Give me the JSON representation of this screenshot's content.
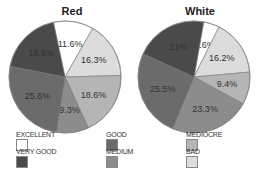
{
  "chart_data": [
    {
      "type": "pie",
      "title": "Red",
      "categories": [
        "EXCELLENT",
        "BAD",
        "MEDIOCRE",
        "MEDIUM",
        "GOOD",
        "VERY GOOD"
      ],
      "values": [
        11.6,
        16.3,
        18.6,
        9.3,
        25.6,
        18.6
      ],
      "labels": [
        "11.6%",
        "16.3%",
        "18.6%",
        "9.3%",
        "25.6%",
        "18.6%"
      ],
      "unit": "%"
    },
    {
      "type": "pie",
      "title": "White",
      "categories": [
        "EXCELLENT",
        "BAD",
        "MEDIOCRE",
        "MEDIUM",
        "GOOD",
        "VERY GOOD"
      ],
      "values": [
        4.6,
        16.2,
        9.4,
        23.3,
        25.5,
        21
      ],
      "labels": [
        "4.6%",
        "16.2%",
        "9.4%",
        "23.3%",
        "25.5%",
        "21%"
      ],
      "unit": "%"
    }
  ],
  "titles": {
    "red": "Red",
    "white": "White"
  },
  "legend": [
    {
      "label": "EXCELLENT",
      "color": "#ffffff"
    },
    {
      "label": "VERY GOOD",
      "color": "#4a4a4a"
    },
    {
      "label": "GOOD",
      "color": "#6b6b6b"
    },
    {
      "label": "MEDIUM",
      "color": "#8c8c8c"
    },
    {
      "label": "MEDIOCRE",
      "color": "#b5b5b5"
    },
    {
      "label": "BAD",
      "color": "#dcdcdc"
    }
  ],
  "colors": {
    "EXCELLENT": "#ffffff",
    "BAD": "#dcdcdc",
    "MEDIOCRE": "#b5b5b5",
    "MEDIUM": "#8c8c8c",
    "GOOD": "#6b6b6b",
    "VERY GOOD": "#4a4a4a"
  }
}
